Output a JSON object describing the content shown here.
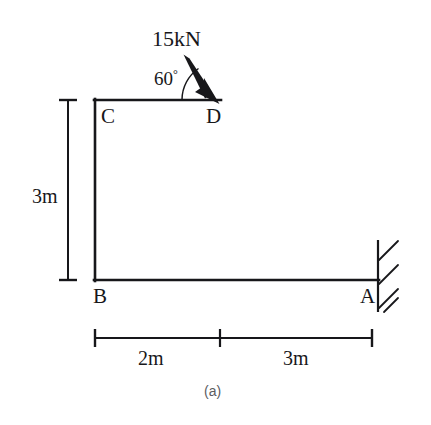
{
  "figure": {
    "caption": "(a)",
    "nodes": [
      {
        "id": "C",
        "label": "C",
        "x": 95,
        "y": 100
      },
      {
        "id": "D",
        "label": "D",
        "x": 220,
        "y": 100
      },
      {
        "id": "B",
        "label": "B",
        "x": 95,
        "y": 280
      },
      {
        "id": "A",
        "label": "A",
        "x": 378,
        "y": 280
      }
    ],
    "load": {
      "magnitude_label": "15kN",
      "angle_label": "60",
      "angle_unit": "°",
      "angle_degrees": 60,
      "applied_at": "D",
      "direction": "down-right"
    },
    "dimensions": {
      "vertical": {
        "label": "3m",
        "value": 3,
        "unit": "m",
        "from": "B",
        "to": "C"
      },
      "horizontal_left": {
        "label": "2m",
        "value": 2,
        "unit": "m",
        "from": "B",
        "to": "D"
      },
      "horizontal_right": {
        "label": "3m",
        "value": 3,
        "unit": "m",
        "from": "D",
        "to": "A"
      }
    },
    "support": {
      "at": "A",
      "type": "fixed",
      "hatch_count": 4
    },
    "colors": {
      "line": "#17171a",
      "background": "#ffffff",
      "caption": "#5c5c5f"
    }
  }
}
